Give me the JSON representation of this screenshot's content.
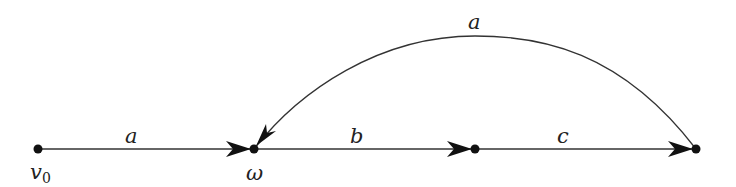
{
  "diagram": {
    "type": "directed-graph",
    "nodes": [
      {
        "id": "v0",
        "label": "v",
        "subscript": "0",
        "x": 38,
        "y": 149
      },
      {
        "id": "omega",
        "label": "ω",
        "x": 254,
        "y": 149
      },
      {
        "id": "n2",
        "label": "",
        "x": 475,
        "y": 149
      },
      {
        "id": "n3",
        "label": "",
        "x": 696,
        "y": 149
      }
    ],
    "edges": [
      {
        "from": "v0",
        "to": "omega",
        "label": "a"
      },
      {
        "from": "omega",
        "to": "n2",
        "label": "b"
      },
      {
        "from": "n2",
        "to": "n3",
        "label": "c"
      },
      {
        "from": "n3",
        "to": "omega",
        "label": "a",
        "curved": true
      }
    ]
  }
}
